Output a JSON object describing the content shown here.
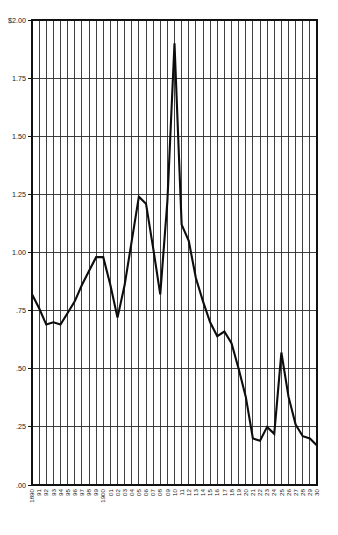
{
  "chart_data": {
    "type": "line",
    "title": "",
    "subtitle": "",
    "xlabel": "",
    "ylabel": "",
    "ylim": [
      0.0,
      2.0
    ],
    "xlim": [
      1890,
      1930
    ],
    "grid": true,
    "legend": null,
    "y_ticks": [
      {
        "value": 2.0,
        "label": "$2.00"
      },
      {
        "value": 1.75,
        "label": "1.75"
      },
      {
        "value": 1.5,
        "label": "1.50"
      },
      {
        "value": 1.25,
        "label": "1.25"
      },
      {
        "value": 1.0,
        "label": "1.00"
      },
      {
        "value": 0.75,
        "label": ".75"
      },
      {
        "value": 0.5,
        "label": ".50"
      },
      {
        "value": 0.25,
        "label": ".25"
      },
      {
        "value": 0.0,
        "label": ".00"
      }
    ],
    "x_tick_labels": [
      "1890",
      "91",
      "92",
      "93",
      "94",
      "95",
      "96",
      "97",
      "98",
      "99",
      "1900",
      "01",
      "02",
      "03",
      "04",
      "05",
      "06",
      "07",
      "08",
      "09",
      "10",
      "11",
      "12",
      "13",
      "14",
      "15",
      "16",
      "17",
      "18",
      "19",
      "20",
      "21",
      "22",
      "23",
      "24",
      "25",
      "26",
      "27",
      "28",
      "29",
      "30"
    ],
    "x": [
      1890,
      1891,
      1892,
      1893,
      1894,
      1895,
      1896,
      1897,
      1898,
      1899,
      1900,
      1901,
      1902,
      1903,
      1904,
      1905,
      1906,
      1907,
      1908,
      1909,
      1910,
      1911,
      1912,
      1913,
      1914,
      1915,
      1916,
      1917,
      1918,
      1919,
      1920,
      1921,
      1922,
      1923,
      1924,
      1925,
      1926,
      1927,
      1928,
      1929,
      1930
    ],
    "values": [
      0.82,
      0.76,
      0.69,
      0.7,
      0.69,
      0.74,
      0.79,
      0.86,
      0.92,
      0.98,
      0.98,
      0.86,
      0.72,
      0.86,
      1.05,
      1.24,
      1.21,
      1.02,
      0.82,
      1.22,
      1.9,
      1.12,
      1.05,
      0.89,
      0.79,
      0.7,
      0.64,
      0.66,
      0.61,
      0.5,
      0.38,
      0.2,
      0.19,
      0.25,
      0.22,
      0.57,
      0.38,
      0.26,
      0.21,
      0.2,
      0.17
    ],
    "series_name": "",
    "line_color": "#0d0d0d",
    "grid_color": "#2b2b2b",
    "background_color": "#ffffff"
  },
  "figure": {
    "currency_prefix": "$"
  }
}
